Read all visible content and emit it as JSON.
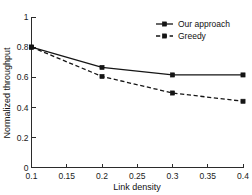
{
  "chart_data": {
    "type": "line",
    "title": "",
    "xlabel": "Link density",
    "ylabel": "Normalized throughput",
    "xlim": [
      0.1,
      0.4
    ],
    "ylim": [
      0,
      1
    ],
    "grid": false,
    "legend_position": "top-right",
    "x": [
      0.1,
      0.2,
      0.3,
      0.4
    ],
    "xticks": [
      "0.1",
      "0.15",
      "0.2",
      "0.25",
      "0.3",
      "0.35",
      "0.4"
    ],
    "xtick_values": [
      0.1,
      0.15,
      0.2,
      0.25,
      0.3,
      0.35,
      0.4
    ],
    "yticks": [
      "0",
      "0.2",
      "0.4",
      "0.6",
      "0.8",
      "1"
    ],
    "ytick_values": [
      0,
      0.2,
      0.4,
      0.6,
      0.8,
      1
    ],
    "series": [
      {
        "name": "Our approach",
        "values": [
          0.8,
          0.665,
          0.615,
          0.615
        ],
        "line_style": "solid",
        "marker": "square",
        "color": "#151515"
      },
      {
        "name": "Greedy",
        "values": [
          0.8,
          0.605,
          0.495,
          0.44
        ],
        "line_style": "dashed",
        "marker": "square",
        "color": "#151515"
      }
    ]
  },
  "legend": {
    "entries": [
      {
        "label": "Our approach"
      },
      {
        "label": "Greedy"
      }
    ]
  },
  "axes": {
    "x_title": "Link density",
    "y_title": "Normalized throughput"
  }
}
